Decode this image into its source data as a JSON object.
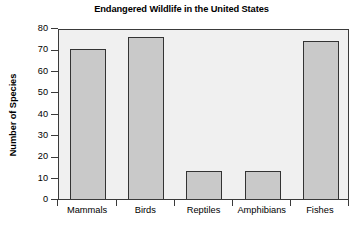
{
  "chart_data": {
    "type": "bar",
    "title": "Endangered Wildlife in the United States",
    "xlabel": "",
    "ylabel": "Number of Species",
    "categories": [
      "Mammals",
      "Birds",
      "Reptiles",
      "Amphibians",
      "Fishes"
    ],
    "values": [
      70,
      76,
      13,
      13,
      74
    ],
    "ylim": [
      0,
      80
    ],
    "ytick_labels": [
      "0",
      "10",
      "20",
      "30",
      "40",
      "50",
      "60",
      "70",
      "80"
    ],
    "ytick_values": [
      0,
      10,
      20,
      30,
      40,
      50,
      60,
      70,
      80
    ],
    "grid": false,
    "legend": "none",
    "colors": {
      "bar_fill": "#c9c9c9",
      "bar_edge": "#333333",
      "plot_background": "#f0f0f0",
      "frame": "#3a3a3a",
      "text": "#000000",
      "figure_background": "#ffffff"
    }
  }
}
